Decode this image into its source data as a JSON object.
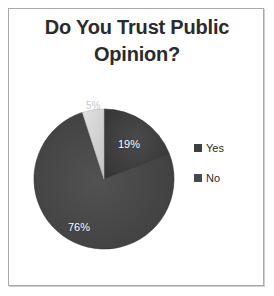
{
  "slide": {
    "background_color": "#ffffff",
    "frame_border_color": "#a9a9a9"
  },
  "title": {
    "line1": "Do You Trust Public",
    "line2": "Opinion?",
    "full": "Do You Trust Public Opinion?",
    "color": "#2b2b2b"
  },
  "legend": {
    "position": "right",
    "items": [
      {
        "label": "Yes",
        "color": "#3f3f3f",
        "marker": "square-marker"
      },
      {
        "label": "No",
        "color": "#4a4a4a",
        "marker": "square-marker"
      }
    ]
  },
  "labels": {
    "slice_19": "19%",
    "slice_76": "76%",
    "slice_5": "5%"
  },
  "chart_data": {
    "type": "pie",
    "title": "Do You Trust Public Opinion?",
    "xlabel": "",
    "ylabel": "",
    "categories": [
      "Yes",
      "No",
      "Unsure"
    ],
    "values": [
      19,
      76,
      5
    ],
    "value_labels": [
      "19%",
      "76%",
      "5%"
    ],
    "colors": [
      "#3f3f3f",
      "#4a4a4a",
      "#d8d8d8"
    ],
    "label_text_colors": [
      "#ffffff",
      "#ffffff",
      "#c8c8c8"
    ],
    "legend_entries": [
      "Yes",
      "No"
    ],
    "legend_position": "right",
    "start_angle_deg": 0,
    "direction": "clockwise",
    "units": "percent",
    "total": 100,
    "grid": false
  }
}
